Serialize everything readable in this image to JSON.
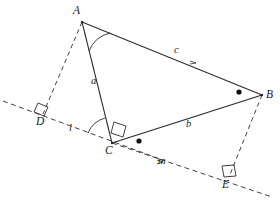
{
  "figure": {
    "kind": "geometry-diagram",
    "width": 280,
    "height": 202,
    "stroke_color": "#2b2b2b",
    "background": "#ffffff"
  },
  "vertices": {
    "A": {
      "label": "A",
      "x": 82,
      "y": 22,
      "label_x": 73,
      "label_y": 6
    },
    "B": {
      "label": "B",
      "x": 262,
      "y": 95,
      "label_x": 266,
      "label_y": 90
    },
    "C": {
      "label": "C",
      "x": 112,
      "y": 143,
      "label_x": 106,
      "label_y": 146
    },
    "D": {
      "label": "D",
      "x": 43,
      "y": 114,
      "label_x": 37,
      "label_y": 117
    },
    "E": {
      "label": "E",
      "x": 229,
      "y": 177,
      "label_x": 223,
      "label_y": 180
    }
  },
  "sides": [
    {
      "name": "a",
      "label": "a",
      "from": "A",
      "to": "C",
      "label_x": 92,
      "label_y": 77
    },
    {
      "name": "b",
      "label": "b",
      "from": "C",
      "to": "B",
      "label_x": 187,
      "label_y": 120
    },
    {
      "name": "c",
      "label": "c",
      "from": "A",
      "to": "B",
      "label_x": 175,
      "label_y": 46
    }
  ],
  "lines": [
    {
      "name": "l",
      "label": "l",
      "label_x": 70,
      "label_y": 124,
      "style": "dashed"
    },
    {
      "name": "m",
      "label": "m",
      "label_x": 159,
      "label_y": 157,
      "style": "dashed"
    }
  ],
  "markers": {
    "right_angles": [
      "at-D",
      "at-C",
      "at-E"
    ],
    "angle_arcs": [
      "at-A",
      "at-C"
    ],
    "dots": [
      {
        "name": "dot-near-C",
        "x": 139,
        "y": 141
      },
      {
        "name": "dot-near-B",
        "x": 239,
        "y": 92
      }
    ]
  }
}
